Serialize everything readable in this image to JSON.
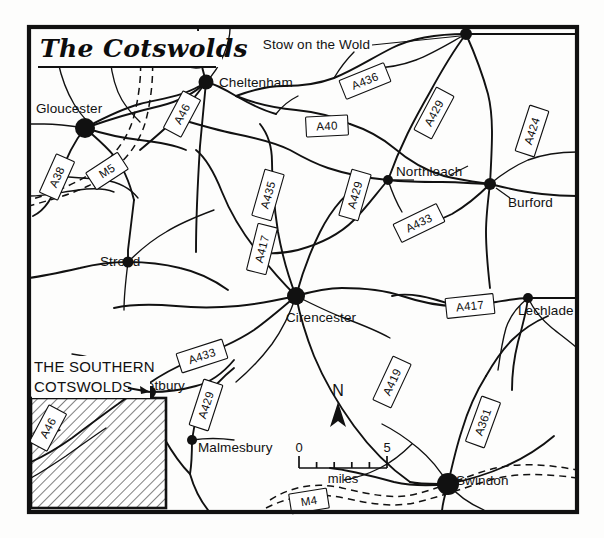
{
  "map": {
    "title": "The Cotswolds",
    "inset_label_line1": "THE SOUTHERN",
    "inset_label_line2": "COTSWOLDS",
    "compass_label": "N",
    "scale": {
      "start": "0",
      "end": "5",
      "unit": "miles"
    },
    "colors": {
      "ink": "#111111",
      "paper": "#fdfdfc",
      "shield_fill": "#ffffff"
    },
    "towns": [
      {
        "name": "Gloucester",
        "size": "large"
      },
      {
        "name": "Cheltenham",
        "size": "large"
      },
      {
        "name": "Stow on the Wold",
        "size": "medium"
      },
      {
        "name": "Northleach",
        "size": "small"
      },
      {
        "name": "Burford",
        "size": "medium"
      },
      {
        "name": "Stroud",
        "size": "medium"
      },
      {
        "name": "Cirencester",
        "size": "large"
      },
      {
        "name": "Lechlade",
        "size": "small"
      },
      {
        "name": "Tetbury",
        "size": "medium"
      },
      {
        "name": "Malmesbury",
        "size": "small"
      },
      {
        "name": "Swindon",
        "size": "large"
      }
    ],
    "roads": [
      {
        "ref": "A38"
      },
      {
        "ref": "M5"
      },
      {
        "ref": "A46"
      },
      {
        "ref": "A40"
      },
      {
        "ref": "A436"
      },
      {
        "ref": "A429"
      },
      {
        "ref": "A424"
      },
      {
        "ref": "A435"
      },
      {
        "ref": "A429"
      },
      {
        "ref": "A433"
      },
      {
        "ref": "A417"
      },
      {
        "ref": "A417"
      },
      {
        "ref": "A433"
      },
      {
        "ref": "A429"
      },
      {
        "ref": "A419"
      },
      {
        "ref": "A361"
      },
      {
        "ref": "A46"
      },
      {
        "ref": "M4"
      }
    ]
  }
}
